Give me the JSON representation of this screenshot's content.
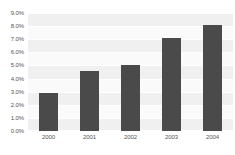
{
  "chart_data": {
    "type": "bar",
    "title": "",
    "subtitle": "",
    "xlabel": "",
    "ylabel": "",
    "categories": [
      "2000",
      "2001",
      "2002",
      "2003",
      "2004"
    ],
    "values": [
      2.9,
      4.6,
      5.05,
      7.1,
      8.1
    ],
    "value_format": "percent",
    "ylim": [
      0.0,
      9.0
    ],
    "ytick_values": [
      0.0,
      1.0,
      2.0,
      3.0,
      4.0,
      5.0,
      6.0,
      7.0,
      8.0,
      9.0
    ],
    "ytick_labels": [
      "0.0%",
      "1.0%",
      "2.0%",
      "3.0%",
      "4.0%",
      "5.0%",
      "6.0%",
      "7.0%",
      "8.0%",
      "9.0%"
    ],
    "grid": true,
    "legend": false,
    "legend_position": "none",
    "bar_color": "#4a4a4a",
    "plot_background": "#fafafa",
    "band_color": "#f0f0f0",
    "gridline_color": "#ffffff",
    "tick_label_color": "#555555",
    "page_background": "#ffffff"
  }
}
